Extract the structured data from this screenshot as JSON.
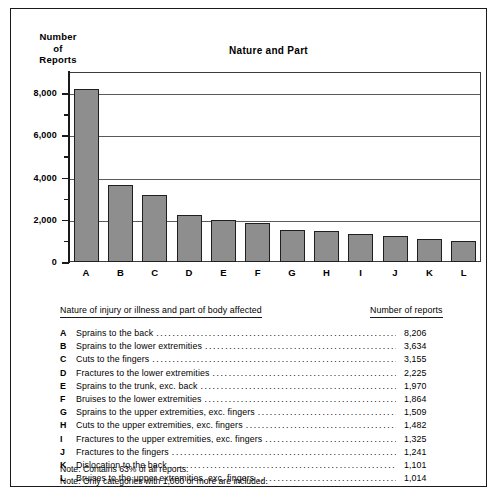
{
  "figure": {
    "title": "Nature and Part",
    "y_axis_title_lines": [
      "Number",
      "of",
      "Reports"
    ]
  },
  "chart_data": {
    "type": "bar",
    "title": "Nature and Part",
    "xlabel": "",
    "ylabel": "Number of Reports",
    "ylim": [
      0,
      9000
    ],
    "grid": true,
    "legend_position": "below-as-table",
    "categories": [
      "A",
      "B",
      "C",
      "D",
      "E",
      "F",
      "G",
      "H",
      "I",
      "J",
      "K",
      "L"
    ],
    "values": [
      8206,
      3634,
      3155,
      2225,
      1970,
      1864,
      1509,
      1482,
      1325,
      1241,
      1101,
      1014
    ],
    "value_labels": [
      "8,206",
      "3,634",
      "3,155",
      "2,225",
      "1,970",
      "1,864",
      "1,509",
      "1,482",
      "1,325",
      "1,241",
      "1,101",
      "1,014"
    ],
    "ytick_values": [
      0,
      2000,
      4000,
      6000,
      8000
    ],
    "ytick_labels": [
      "0",
      "2,000",
      "4,000",
      "6,000",
      "8,000"
    ],
    "yminor_values": [
      1000,
      3000,
      5000,
      7000
    ],
    "bar_color": "#8e8e8e",
    "bar_edge_color": "#1f1f1f",
    "series_descriptions": [
      "Sprains to the back",
      "Sprains to the lower extremities",
      "Cuts to the fingers",
      "Fractures to the lower extremities",
      "Sprains to the trunk, exc. back",
      "Bruises to the lower extremities",
      "Sprains to the upper extremities, exc. fingers",
      "Cuts to the upper extremities, exc. fingers",
      "Fractures to the upper extremities, exc. fingers",
      "Fractures to the fingers",
      "Dislocation to the back",
      "Bruises to the upper extremities, exc. fingers"
    ]
  },
  "legend": {
    "header_nature": "Nature of injury or illness and part of body affected",
    "header_count": "Number of reports",
    "rows": [
      {
        "key": "A",
        "desc": "Sprains to the back",
        "value": "8,206"
      },
      {
        "key": "B",
        "desc": "Sprains to the lower extremities",
        "value": "3,634"
      },
      {
        "key": "C",
        "desc": "Cuts to the fingers",
        "value": "3,155"
      },
      {
        "key": "D",
        "desc": "Fractures to the lower extremities",
        "value": "2,225"
      },
      {
        "key": "E",
        "desc": "Sprains to the trunk, exc. back",
        "value": "1,970"
      },
      {
        "key": "F",
        "desc": "Bruises to the lower extremities",
        "value": "1,864"
      },
      {
        "key": "G",
        "desc": "Sprains to the upper extremities, exc. fingers",
        "value": "1,509"
      },
      {
        "key": "H",
        "desc": "Cuts to the upper extremities, exc. fingers",
        "value": "1,482"
      },
      {
        "key": "I",
        "desc": "Fractures to the upper extremities, exc. fingers",
        "value": "1,325"
      },
      {
        "key": "J",
        "desc": "Fractures to the fingers",
        "value": "1,241"
      },
      {
        "key": "K",
        "desc": "Dislocation to the back",
        "value": "1,101"
      },
      {
        "key": "L",
        "desc": "Bruises to the upper extremities, exc. fingers",
        "value": "1,014"
      }
    ]
  },
  "notes": [
    "Note: Contains 63% of all reports.",
    "Note: Only categories with 1,000 or more are included."
  ]
}
